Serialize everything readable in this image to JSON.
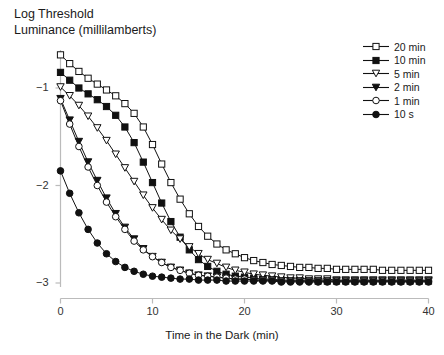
{
  "chart_data": {
    "type": "line",
    "title_line1": "Log Threshold",
    "title_line2": "Luminance (millilamberts)",
    "xlabel": "Time in the Dark (min)",
    "ylabel": "Log Threshold Luminance (millilamberts)",
    "xlim": [
      0,
      40
    ],
    "ylim": [
      -3.1,
      -0.55
    ],
    "xticks": [
      0,
      10,
      20,
      30,
      40
    ],
    "xtick_labels": [
      "0",
      "10",
      "20",
      "30",
      "40"
    ],
    "yticks": [
      -1,
      -2,
      -3
    ],
    "ytick_labels": [
      "−1",
      "−2",
      "−3"
    ],
    "grid": false,
    "legend_position": "top-right",
    "x": [
      0,
      1,
      2,
      3,
      4,
      5,
      6,
      7,
      8,
      9,
      10,
      11,
      12,
      13,
      14,
      15,
      16,
      17,
      18,
      19,
      20,
      21,
      22,
      23,
      24,
      25,
      26,
      27,
      28,
      29,
      30,
      31,
      32,
      33,
      34,
      35,
      36,
      37,
      38,
      39,
      40
    ],
    "series": [
      {
        "name": "20 min",
        "marker": "open-square",
        "values": [
          -0.66,
          -0.75,
          -0.83,
          -0.9,
          -0.96,
          -1.02,
          -1.08,
          -1.16,
          -1.26,
          -1.4,
          -1.58,
          -1.78,
          -1.97,
          -2.14,
          -2.29,
          -2.42,
          -2.52,
          -2.6,
          -2.66,
          -2.7,
          -2.74,
          -2.77,
          -2.79,
          -2.81,
          -2.82,
          -2.83,
          -2.84,
          -2.84,
          -2.85,
          -2.85,
          -2.86,
          -2.86,
          -2.86,
          -2.86,
          -2.86,
          -2.87,
          -2.87,
          -2.87,
          -2.87,
          -2.87,
          -2.87
        ]
      },
      {
        "name": "10 min",
        "marker": "filled-square",
        "values": [
          -0.84,
          -0.92,
          -1.0,
          -1.06,
          -1.12,
          -1.19,
          -1.28,
          -1.4,
          -1.56,
          -1.76,
          -1.97,
          -2.18,
          -2.37,
          -2.53,
          -2.66,
          -2.76,
          -2.83,
          -2.88,
          -2.91,
          -2.93,
          -2.94,
          -2.95,
          -2.96,
          -2.96,
          -2.97,
          -2.97,
          -2.97,
          -2.97,
          -2.98,
          -2.98,
          -2.98,
          -2.98,
          -2.98,
          -2.98,
          -2.98,
          -2.98,
          -2.98,
          -2.98,
          -2.98,
          -2.98,
          -2.98
        ]
      },
      {
        "name": "5 min",
        "marker": "open-triangle-down",
        "values": [
          -0.99,
          -1.08,
          -1.18,
          -1.29,
          -1.41,
          -1.54,
          -1.68,
          -1.82,
          -1.96,
          -2.1,
          -2.23,
          -2.35,
          -2.46,
          -2.55,
          -2.63,
          -2.7,
          -2.76,
          -2.8,
          -2.84,
          -2.87,
          -2.89,
          -2.91,
          -2.92,
          -2.93,
          -2.94,
          -2.95,
          -2.95,
          -2.96,
          -2.96,
          -2.96,
          -2.97,
          -2.97,
          -2.97,
          -2.97,
          -2.97,
          -2.97,
          -2.97,
          -2.97,
          -2.97,
          -2.97,
          -2.97
        ]
      },
      {
        "name": "2 min",
        "marker": "filled-triangle-down",
        "values": [
          -1.11,
          -1.33,
          -1.55,
          -1.76,
          -1.95,
          -2.13,
          -2.29,
          -2.43,
          -2.55,
          -2.65,
          -2.73,
          -2.79,
          -2.84,
          -2.87,
          -2.9,
          -2.92,
          -2.93,
          -2.94,
          -2.95,
          -2.96,
          -2.96,
          -2.97,
          -2.97,
          -2.97,
          -2.98,
          -2.98,
          -2.98,
          -2.98,
          -2.98,
          -2.98,
          -2.98,
          -2.98,
          -2.98,
          -2.98,
          -2.98,
          -2.98,
          -2.98,
          -2.98,
          -2.98,
          -2.98,
          -2.98
        ]
      },
      {
        "name": "1 min",
        "marker": "open-circle",
        "values": [
          -1.13,
          -1.37,
          -1.6,
          -1.81,
          -2.0,
          -2.17,
          -2.32,
          -2.45,
          -2.57,
          -2.66,
          -2.73,
          -2.79,
          -2.84,
          -2.87,
          -2.9,
          -2.92,
          -2.93,
          -2.94,
          -2.95,
          -2.96,
          -2.96,
          -2.97,
          -2.97,
          -2.97,
          -2.98,
          -2.98,
          -2.98,
          -2.98,
          -2.98,
          -2.98,
          -2.98,
          -2.98,
          -2.98,
          -2.98,
          -2.98,
          -2.98,
          -2.98,
          -2.98,
          -2.98,
          -2.98,
          -2.98
        ]
      },
      {
        "name": "10 s",
        "marker": "filled-circle",
        "values": [
          -1.85,
          -2.08,
          -2.28,
          -2.45,
          -2.59,
          -2.7,
          -2.78,
          -2.84,
          -2.88,
          -2.91,
          -2.93,
          -2.94,
          -2.95,
          -2.96,
          -2.96,
          -2.97,
          -2.97,
          -2.97,
          -2.98,
          -2.98,
          -2.98,
          -2.98,
          -2.98,
          -2.98,
          -2.99,
          -2.99,
          -2.99,
          -2.99,
          -2.99,
          -2.99,
          -2.99,
          -2.99,
          -2.99,
          -2.99,
          -2.99,
          -2.99,
          -2.99,
          -2.99,
          -2.99,
          -2.99,
          -2.99
        ]
      }
    ],
    "colors": {
      "line": "#111111",
      "marker_fill_open": "#ffffff",
      "marker_fill_closed": "#111111",
      "axis": "#bbbbbb",
      "text": "#1a1a1a"
    }
  }
}
